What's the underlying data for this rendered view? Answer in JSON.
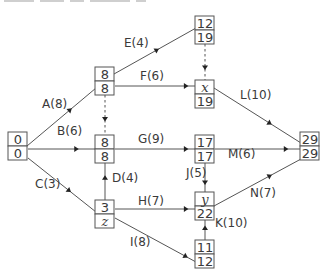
{
  "diagram": {
    "type": "activity-network",
    "nodes": [
      {
        "id": "start",
        "top": "0",
        "bottom": "0",
        "top_italic": false,
        "bottom_italic": false
      },
      {
        "id": "n1",
        "top": "8",
        "bottom": "8",
        "top_italic": false,
        "bottom_italic": false
      },
      {
        "id": "n2",
        "top": "12",
        "bottom": "19",
        "top_italic": false,
        "bottom_italic": false
      },
      {
        "id": "n3",
        "top": "x",
        "bottom": "19",
        "top_italic": true,
        "bottom_italic": false
      },
      {
        "id": "n4",
        "top": "8",
        "bottom": "8",
        "top_italic": false,
        "bottom_italic": false
      },
      {
        "id": "n5",
        "top": "17",
        "bottom": "17",
        "top_italic": false,
        "bottom_italic": false
      },
      {
        "id": "n6",
        "top": "3",
        "bottom": "z",
        "top_italic": false,
        "bottom_italic": true
      },
      {
        "id": "n7",
        "top": "y",
        "bottom": "22",
        "top_italic": true,
        "bottom_italic": false
      },
      {
        "id": "n8",
        "top": "11",
        "bottom": "12",
        "top_italic": false,
        "bottom_italic": false
      },
      {
        "id": "end",
        "top": "29",
        "bottom": "29",
        "top_italic": false,
        "bottom_italic": false
      }
    ],
    "edges": [
      {
        "label": "A(8)",
        "from": "start",
        "to": "n1",
        "dummy": false
      },
      {
        "label": "B(6)",
        "from": "start",
        "to": "n4",
        "dummy": false
      },
      {
        "label": "C(3)",
        "from": "start",
        "to": "n6",
        "dummy": false
      },
      {
        "label": "D(4)",
        "from": "n6",
        "to": "n4",
        "dummy": false
      },
      {
        "label": "E(4)",
        "from": "n1",
        "to": "n2",
        "dummy": false
      },
      {
        "label": "F(6)",
        "from": "n1",
        "to": "n3",
        "dummy": false
      },
      {
        "label": "G(9)",
        "from": "n4",
        "to": "n5",
        "dummy": false
      },
      {
        "label": "H(7)",
        "from": "n6",
        "to": "n7",
        "dummy": false
      },
      {
        "label": "I(8)",
        "from": "n6",
        "to": "n8",
        "dummy": false
      },
      {
        "label": "J(5)",
        "from": "n5",
        "to": "n7",
        "dummy": false
      },
      {
        "label": "K(10)",
        "from": "n8",
        "to": "n7",
        "dummy": false
      },
      {
        "label": "L(10)",
        "from": "n3",
        "to": "end",
        "dummy": false
      },
      {
        "label": "M(6)",
        "from": "n5",
        "to": "end",
        "dummy": false
      },
      {
        "label": "N(7)",
        "from": "n7",
        "to": "end",
        "dummy": false
      },
      {
        "label": "",
        "from": "n1",
        "to": "n4",
        "dummy": true
      },
      {
        "label": "",
        "from": "n2",
        "to": "n3",
        "dummy": true
      }
    ]
  }
}
